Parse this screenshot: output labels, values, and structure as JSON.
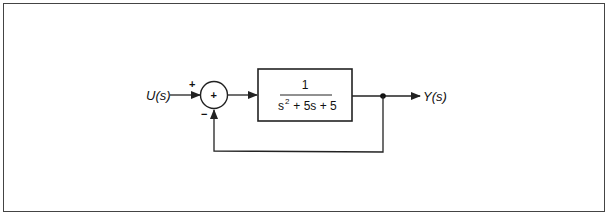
{
  "diagram": {
    "type": "closed-loop negative feedback block diagram",
    "input": {
      "label": "U(s)"
    },
    "output": {
      "label": "Y(s)"
    },
    "summing_junction": {
      "center_sign": "+",
      "input_sign": "+",
      "feedback_sign": "−"
    },
    "transfer_block": {
      "numerator": "1",
      "denominator_parts": [
        "s",
        "2",
        " + 5s + 5"
      ],
      "denominator_text": "s^2 + 5s + 5"
    },
    "feedback": {
      "type": "unity",
      "sign": "negative"
    },
    "colors": {
      "line": "#222222",
      "background": "#ffffff",
      "frame": "#444444"
    }
  }
}
